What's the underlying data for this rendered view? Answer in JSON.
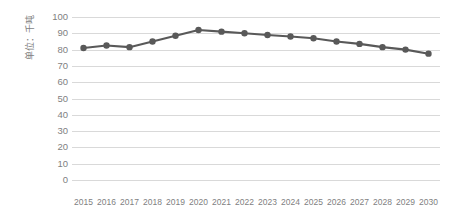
{
  "chart_data": {
    "type": "line",
    "title": "",
    "subtitle": "",
    "xlabel": "",
    "ylabel": "单位：千吨",
    "categories": [
      "2015",
      "2016",
      "2017",
      "2018",
      "2019",
      "2020",
      "2021",
      "2022",
      "2023",
      "2024",
      "2025",
      "2026",
      "2027",
      "2028",
      "2029",
      "2030"
    ],
    "values": [
      81,
      82.5,
      81.5,
      85,
      88.5,
      92,
      91,
      90,
      89,
      88,
      87,
      85,
      83.5,
      81.5,
      80,
      77.5
    ],
    "series": [
      {
        "name": "",
        "values": [
          81,
          82.5,
          81.5,
          85,
          88.5,
          92,
          91,
          90,
          89,
          88,
          87,
          85,
          83.5,
          81.5,
          80,
          77.5
        ]
      }
    ],
    "ylim": [
      0,
      100
    ],
    "ytick_step": 10,
    "yticks": [
      100,
      90,
      80,
      70,
      60,
      50,
      40,
      30,
      20,
      10,
      0
    ],
    "grid": true,
    "grid_axis": "y",
    "legend": false,
    "legend_position": "none",
    "marker": "circle",
    "annotations": []
  },
  "style": {
    "line_color": "#595959",
    "marker_color": "#595959",
    "gridline_color": "#d9d9d9",
    "tick_label_color": "#7f7f7f",
    "axis_title_color": "#7f7f7f",
    "background_color": "#ffffff"
  }
}
